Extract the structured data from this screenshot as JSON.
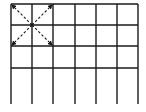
{
  "diagram": {
    "type": "grid-with-diagonals",
    "line_color": "#1a1a1a",
    "dash_color": "#1a1a1a",
    "background": "#ffffff",
    "vertical_lines_x": [
      11,
      32,
      53,
      75,
      96,
      117,
      138
    ],
    "horizontal_lines_y": [
      4,
      25,
      46,
      68
    ],
    "vertical_line_top": 4,
    "vertical_line_bottom": 104,
    "horizontal_line_left": 11,
    "horizontal_line_right": 138,
    "columns": 6,
    "closed_rows": 3,
    "center_point": {
      "x": 32,
      "y": 25
    },
    "diagonal_arrows": [
      {
        "name": "to-top-left",
        "x2": 12,
        "y2": 5
      },
      {
        "name": "to-top-right",
        "x2": 52,
        "y2": 5
      },
      {
        "name": "to-bottom-left",
        "x2": 12,
        "y2": 45
      },
      {
        "name": "to-bottom-right",
        "x2": 52,
        "y2": 45
      }
    ]
  }
}
